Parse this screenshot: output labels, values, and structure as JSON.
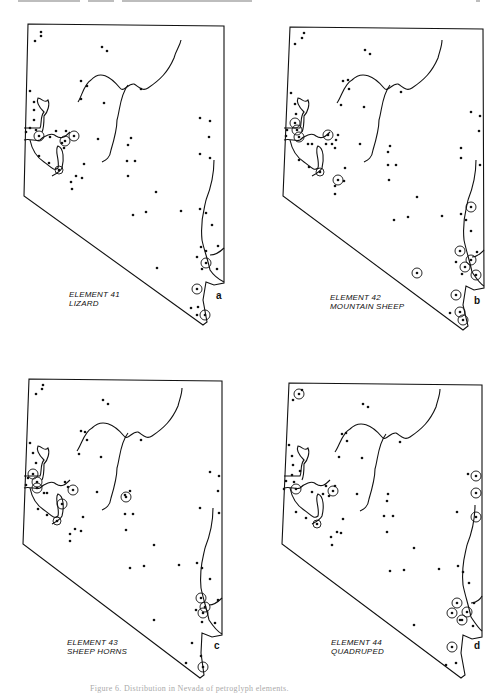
{
  "page": {
    "caption": "Figure 6. Distribution in Nevada of petroglyph elements."
  },
  "panels": [
    {
      "id": "a",
      "letter": "a",
      "element": "ELEMENT 41",
      "name": "LIZARD"
    },
    {
      "id": "b",
      "letter": "b",
      "element": "ELEMENT 42",
      "name": "MOUNTAIN SHEEP"
    },
    {
      "id": "c",
      "letter": "c",
      "element": "ELEMENT 43",
      "name": "SHEEP HORNS"
    },
    {
      "id": "d",
      "letter": "d",
      "element": "ELEMENT 44",
      "name": "QUADRUPED"
    }
  ],
  "legend": {
    "dot": "site without element",
    "circled-dot": "site with element"
  },
  "colors": {
    "ink": "#111111",
    "paper": "#ffffff"
  }
}
